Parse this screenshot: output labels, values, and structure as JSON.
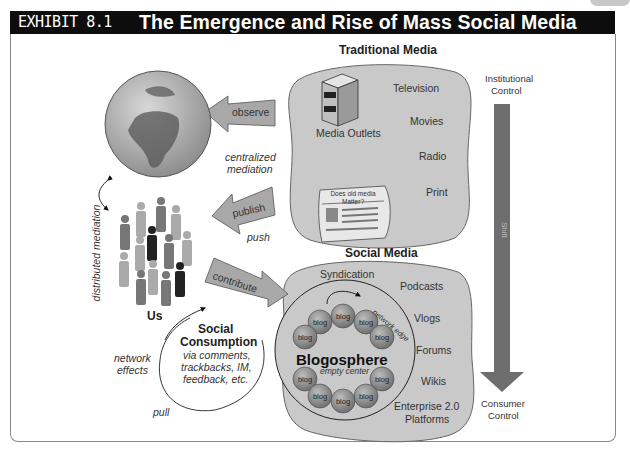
{
  "header": {
    "exhibit": "EXHIBIT 8.1",
    "title": "The Emergence and Rise of Mass Social Media"
  },
  "traditional_media": {
    "heading": "Traditional Media",
    "outlets_label": "Media Outlets",
    "newspaper_headline": "Does old media Matter?",
    "items": [
      "Television",
      "Movies",
      "Radio",
      "Print"
    ]
  },
  "social_media": {
    "heading": "Social Media",
    "syndication": "Syndication",
    "network_edge": "network edge",
    "blogosphere": "Blogosphere",
    "empty_center": "empty center",
    "blog_label": "blog",
    "items": [
      "Podcasts",
      "Vlogs",
      "Forums",
      "Wikis",
      "Enterprise 2.0",
      "Platforms"
    ]
  },
  "arrows": {
    "observe": "observe",
    "publish": "publish",
    "contribute": "contribute",
    "push": "push",
    "pull": "pull"
  },
  "left": {
    "centralized": "centralized",
    "mediation": "mediation",
    "distributed_mediation": "distributed mediation",
    "us": "Us",
    "network": "network",
    "effects": "effects"
  },
  "social_consumption": {
    "title1": "Social",
    "title2": "Consumption",
    "line1": "via comments,",
    "line2": "trackbacks, IM,",
    "line3": "feedback, etc."
  },
  "shift_axis": {
    "top1": "Institutional",
    "top2": "Control",
    "shift": "Shift",
    "bottom1": "Consumer",
    "bottom2": "Control"
  },
  "colors": {
    "title_bar": "#0d0d0d",
    "blob_fill": "#c9c9c9",
    "arrow_fill": "#a8a8a8",
    "shift_arrow": "#6e6e6e"
  }
}
